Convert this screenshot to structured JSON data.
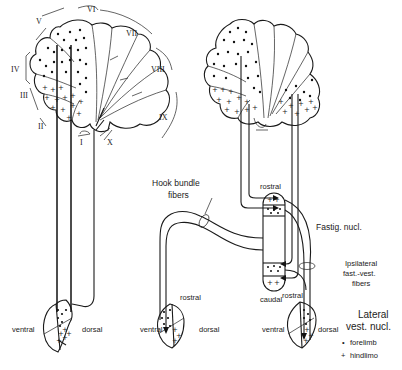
{
  "figure": {
    "left_panel": {
      "lobule_labels": [
        "I",
        "II",
        "III",
        "IV",
        "V",
        "VI",
        "VII",
        "VIII",
        "IX",
        "X"
      ],
      "nucleus_labels": {
        "ventral": "ventral",
        "dorsal": "dorsal"
      }
    },
    "right_panel": {
      "hook_bundle_label_line1": "Hook bundle",
      "hook_bundle_label_line2": "fibers",
      "fastigial": {
        "rostral": "rostral",
        "caudal": "caudal",
        "label": "Fastig. nucl."
      },
      "ipsilateral_label_line1": "Ipsilateral",
      "ipsilateral_label_line2": "fast.-vest.",
      "ipsilateral_label_line3": "fibers",
      "middle_nucleus": {
        "rostral": "rostral",
        "ventral": "ventral",
        "dorsal": "dorsal"
      },
      "right_nucleus": {
        "rostral": "rostral",
        "ventral": "ventral",
        "dorsal": "dorsal"
      },
      "lateral_vest_label_line1": "Lateral",
      "lateral_vest_label_line2": "vest. nucl."
    },
    "legend": {
      "items": [
        {
          "symbol": "•",
          "label": "forelimb"
        },
        {
          "symbol": "+",
          "label": "hindlimo"
        }
      ]
    }
  }
}
